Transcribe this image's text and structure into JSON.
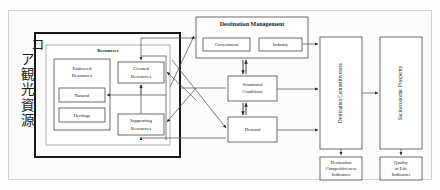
{
  "figure": {
    "core_label_vertical": "コア観光資源",
    "core_label_reading": "Core Tourism Resources"
  },
  "colors": {
    "page_background": "#ffffff",
    "frame_background": "#fcfcfc",
    "frame_border": "#c8c8c8",
    "box_fill": "#ffffff",
    "box_border": "#4a4a4a",
    "box_border_thick": "#1a1a1a",
    "box_border_light": "#8a8a8a",
    "connector": "#5a5a5a",
    "text": "#1a1a1a"
  },
  "core_group": {
    "name": "core-tourism-resources-group",
    "resources_section_label": "Resources",
    "boxes": {
      "endowed_resources": "Endowed\nResources",
      "endowed_resources_line1": "Endowed",
      "endowed_resources_line2": "Resources",
      "natural": "Natural",
      "heritage": "Heritage",
      "created_resources_line1": "Created",
      "created_resources_line2": "Resources",
      "supporting_resources_line1": "Supporting",
      "supporting_resources_line2": "Resources"
    }
  },
  "destination_management": {
    "title": "Destination Management",
    "government": "Government",
    "industry": "Industry"
  },
  "middle_column": {
    "situational_conditions_line1": "Situational",
    "situational_conditions_line2": "Conditions",
    "demand": "Demand"
  },
  "outcome_columns": {
    "destination_competitiveness": "Destination Competitiveness",
    "socioeconomic_prosperity": "Socioeconomic Prosperity"
  },
  "indicators": {
    "destination_competitiveness_indicators_line1": "Destination",
    "destination_competitiveness_indicators_line2": "Competitiveness",
    "destination_competitiveness_indicators_line3": "Indicators",
    "quality_of_life_indicators_line1": "Quality",
    "quality_of_life_indicators_line2": "of Life",
    "quality_of_life_indicators_line3": "Indicators"
  }
}
